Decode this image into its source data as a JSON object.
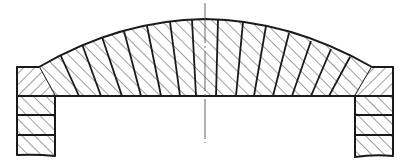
{
  "figure": {
    "type": "arch-section-drawing",
    "colors": {
      "line": "#1a1a1a",
      "background": "#ffffff"
    },
    "arch": {
      "intrados_y": 96,
      "extrados": {
        "left": [
          39,
          67
        ],
        "crown": [
          205,
          19
        ],
        "right": [
          372,
          67
        ]
      },
      "voussoir_count": 15
    },
    "abutments": [
      {
        "side": "left",
        "x": 17,
        "width": 38,
        "top": 67,
        "bottom": 156,
        "courses_y": [
          96,
          115,
          135
        ]
      },
      {
        "side": "right",
        "x": 355,
        "width": 38,
        "top": 67,
        "bottom": 156,
        "courses_y": [
          96,
          115,
          135
        ]
      }
    ],
    "centerline": {
      "x": 205,
      "y1": 3,
      "y2": 143
    }
  }
}
